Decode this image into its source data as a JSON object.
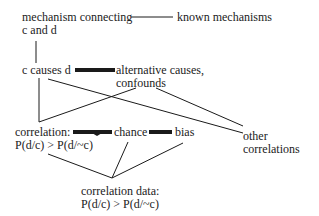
{
  "diagram": {
    "nodes": {
      "mechanism": {
        "line1": "mechanism connecting",
        "line2": "c and d"
      },
      "known": {
        "label": "known mechanisms"
      },
      "causes": {
        "label": "c causes d"
      },
      "alternative": {
        "line1": "alternative causes,",
        "line2": "confounds"
      },
      "correlation": {
        "line1": "correlation:",
        "line2": "P(d/c) > P(d/~c)"
      },
      "chance": {
        "label": "chance"
      },
      "bias": {
        "label": "bias"
      },
      "other": {
        "line1": "other",
        "line2": "correlations"
      },
      "data": {
        "line1": "correlation data:",
        "line2": "P(d/c) > P(d/~c)"
      }
    },
    "colors": {
      "line": "#1a1a1a",
      "text": "#222222",
      "background": "#ffffff"
    }
  }
}
